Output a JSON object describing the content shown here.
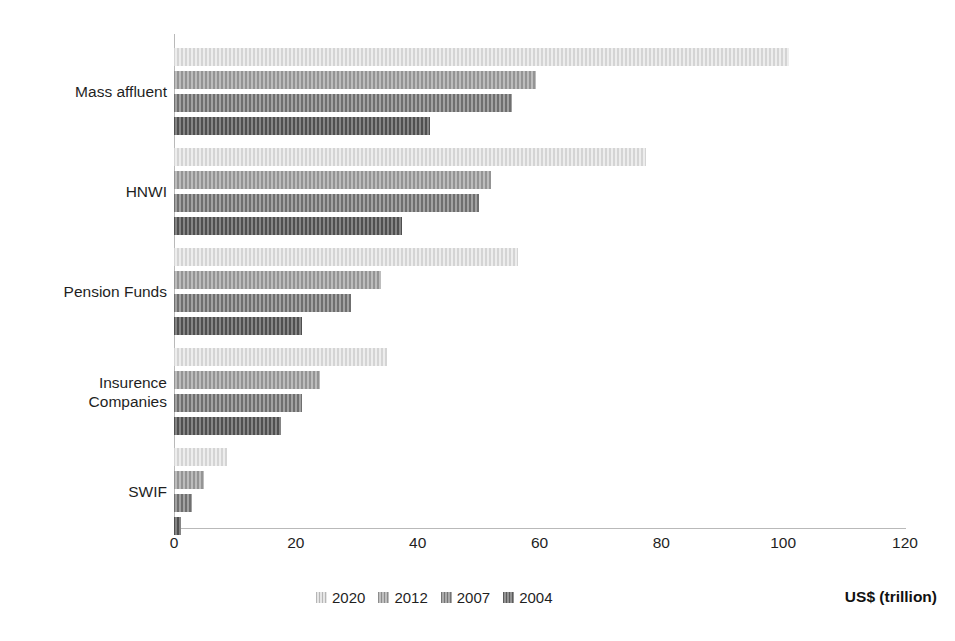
{
  "chart_data": {
    "type": "bar",
    "orientation": "horizontal",
    "title": "",
    "xlabel": "US$ (trillion)",
    "ylabel": "",
    "xlim": [
      0,
      120
    ],
    "xticks": [
      0,
      20,
      40,
      60,
      80,
      100,
      120
    ],
    "grid": false,
    "legend_position": "bottom",
    "categories": [
      "Mass affluent",
      "HNWI",
      "Pension Funds",
      "Insurence Companies",
      "SWIF"
    ],
    "series": [
      {
        "name": "2020",
        "color": "#dedede",
        "values": [
          101,
          77.5,
          56.5,
          35,
          8.7
        ]
      },
      {
        "name": "2012",
        "color": "#ababab",
        "values": [
          59.5,
          52,
          34,
          24,
          5
        ]
      },
      {
        "name": "2007",
        "color": "#8d8d8d",
        "values": [
          55.5,
          50,
          29,
          21,
          3
        ]
      },
      {
        "name": "2004",
        "color": "#6f6f6f",
        "values": [
          42,
          37.5,
          21,
          17.5,
          1.2
        ]
      }
    ]
  },
  "legend": {
    "items": [
      {
        "label": "2020"
      },
      {
        "label": "2012"
      },
      {
        "label": "2007"
      },
      {
        "label": "2004"
      }
    ]
  },
  "axis": {
    "x_title": "US$ (trillion)"
  }
}
